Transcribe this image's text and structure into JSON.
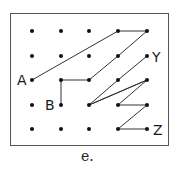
{
  "caption": "e.",
  "grid": {
    "cols": [
      32,
      61,
      89,
      118,
      147
    ],
    "rows": [
      31,
      56,
      80,
      105,
      129
    ]
  },
  "labels": [
    {
      "text": "A",
      "x": 17,
      "y": 73
    },
    {
      "text": "B",
      "x": 45,
      "y": 98
    },
    {
      "text": "Y",
      "x": 152,
      "y": 50
    },
    {
      "text": "Z",
      "x": 153,
      "y": 123
    }
  ],
  "path": [
    {
      "note": "A to top",
      "points": [
        [
          0,
          2
        ],
        [
          3,
          0
        ],
        [
          4,
          0
        ],
        [
          3,
          1
        ],
        [
          2,
          2
        ],
        [
          1,
          2
        ],
        [
          1,
          3
        ]
      ]
    },
    {
      "note": "Y to Z",
      "points": [
        [
          4,
          1
        ],
        [
          3,
          2
        ],
        [
          2,
          3
        ],
        [
          4,
          2
        ],
        [
          3,
          3
        ],
        [
          4,
          3
        ],
        [
          3,
          4
        ],
        [
          4,
          4
        ]
      ]
    },
    {
      "note": "extra",
      "points": [
        [
          2,
          3
        ],
        [
          4,
          2
        ]
      ]
    }
  ],
  "colors": {
    "line": "#333333",
    "dot": "#111111",
    "border": "#555555"
  }
}
